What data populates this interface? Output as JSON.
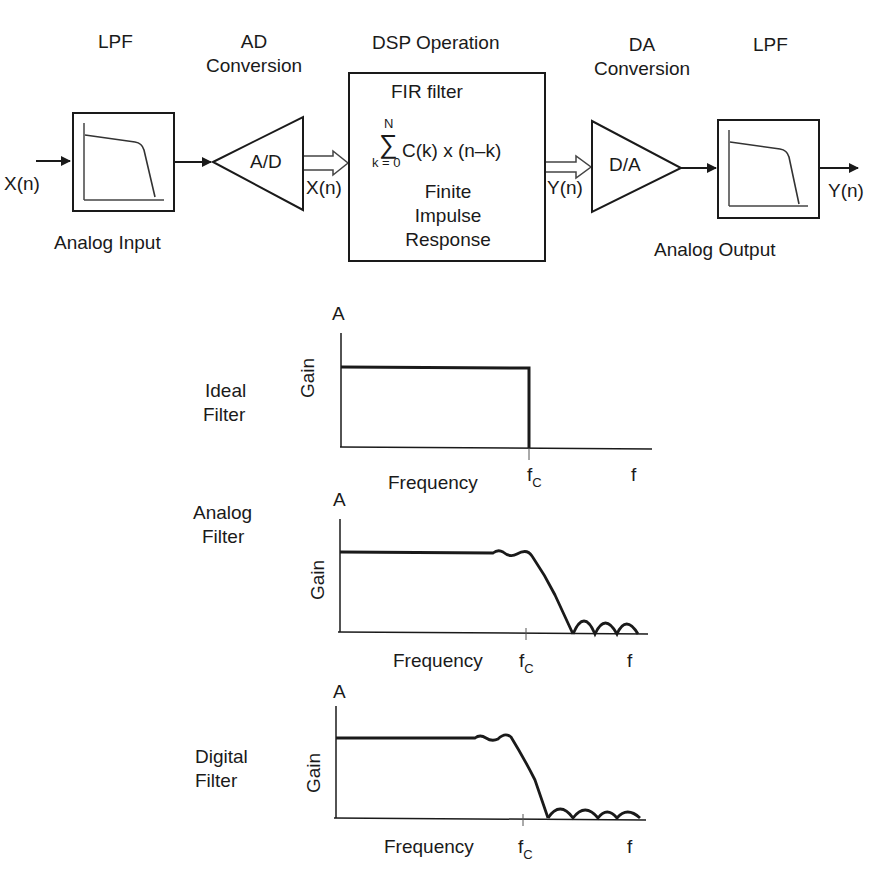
{
  "top_chain": {
    "stages": [
      {
        "id": "lpf-in",
        "title": "LPF",
        "caption": "Analog Input"
      },
      {
        "id": "adc",
        "title_line1": "AD",
        "title_line2": "Conversion",
        "block_label": "A/D"
      },
      {
        "id": "dsp",
        "title": "DSP Operation",
        "block_title": "FIR filter",
        "formula": {
          "upper": "N",
          "sigma": "∑",
          "lower": "k = 0",
          "body": "C(k) x (n–k)"
        },
        "desc_line1": "Finite",
        "desc_line2": "Impulse",
        "desc_line3": "Response"
      },
      {
        "id": "dac",
        "title_line1": "DA",
        "title_line2": "Conversion",
        "block_label": "D/A"
      },
      {
        "id": "lpf-out",
        "title": "LPF",
        "caption": "Analog Output"
      }
    ],
    "signals": {
      "input": "X(n)",
      "adc_out": "X(n)",
      "dsp_out": "Y(n)",
      "output": "Y(n)"
    }
  },
  "charts": [
    {
      "id": "ideal",
      "label_line1": "Ideal",
      "label_line2": "Filter",
      "y_axis_top": "A",
      "y_label": "Gain",
      "x_label": "Frequency",
      "fc_main": "f",
      "fc_sub": "C",
      "f_label": "f"
    },
    {
      "id": "analog",
      "label_line1": "Analog",
      "label_line2": "Filter",
      "y_axis_top": "A",
      "y_label": "Gain",
      "x_label": "Frequency",
      "fc_main": "f",
      "fc_sub": "C",
      "f_label": "f"
    },
    {
      "id": "digital",
      "label_line1": "Digital",
      "label_line2": "Filter",
      "y_axis_top": "A",
      "y_label": "Gain",
      "x_label": "Frequency",
      "fc_main": "f",
      "fc_sub": "C",
      "f_label": "f"
    }
  ],
  "colors": {
    "stroke": "#1a1a1a",
    "background": "#ffffff"
  }
}
